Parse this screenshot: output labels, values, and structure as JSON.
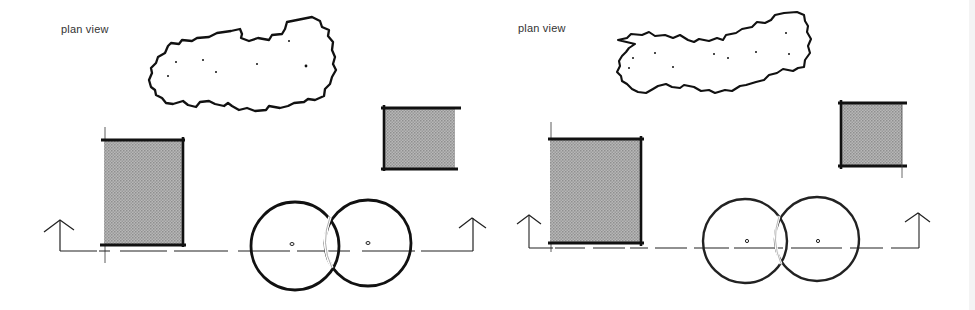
{
  "figure": {
    "colors": {
      "background": "#ffffff",
      "line": "#111111",
      "fill_shade": "#a9a9a9",
      "label": "#333333"
    }
  },
  "panels": [
    {
      "id": "left",
      "label": "plan view",
      "elements": {
        "canopy": {
          "type": "irregular-outline",
          "dots": 7
        },
        "tall_block": {
          "type": "shaded-rect"
        },
        "small_block": {
          "type": "shaded-rect"
        },
        "circles": {
          "count": 2,
          "overlapping": true
        },
        "section_line": {
          "style": "dash-dot",
          "arrows": 2
        }
      }
    },
    {
      "id": "right",
      "label": "plan view",
      "elements": {
        "canopy": {
          "type": "irregular-outline",
          "dots": 10
        },
        "tall_block": {
          "type": "shaded-rect"
        },
        "small_block": {
          "type": "shaded-rect"
        },
        "circles": {
          "count": 2,
          "overlapping": true
        },
        "section_line": {
          "style": "dash-dot",
          "arrows": 2
        }
      }
    }
  ]
}
